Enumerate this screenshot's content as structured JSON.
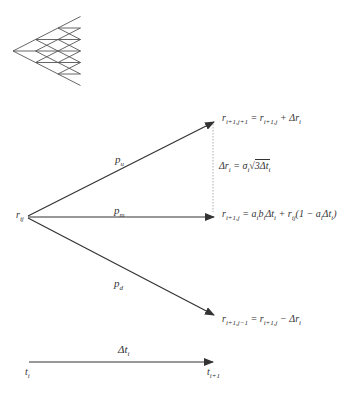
{
  "tree": {
    "description": "trinomial tree",
    "levels": 4
  },
  "labels": {
    "r_ij": "r",
    "r_ij_sub": "ij",
    "p_u": "p",
    "p_u_sub": "u",
    "p_m": "p",
    "p_m_sub": "m",
    "p_d": "p",
    "p_d_sub": "d",
    "eq_up_lhs": "r",
    "eq_up_lhs_sub": "i+1,j+1",
    "eq_up_rhs": " = r",
    "eq_up_rhs_sub": "i+1,j",
    "eq_up_tail": " + Δr",
    "eq_up_tail_sub": "i",
    "eq_dr_lhs": "Δr",
    "eq_dr_lhs_sub": "i",
    "eq_dr_mid": " = σ",
    "eq_dr_mid_sub": "i",
    "eq_dr_sqrt": "3Δt",
    "eq_dr_sqrt_sub": "i",
    "eq_mid_lhs": "r",
    "eq_mid_lhs_sub": "i+1,j",
    "eq_mid_a1": " = a",
    "eq_mid_a1_sub": "i",
    "eq_mid_b": "b",
    "eq_mid_b_sub": "i",
    "eq_mid_dt": "Δt",
    "eq_mid_dt_sub": "i",
    "eq_mid_plus": " + r",
    "eq_mid_plus_sub": "ij",
    "eq_mid_paren": "(1 − a",
    "eq_mid_paren_sub": "i",
    "eq_mid_dt2": "Δt",
    "eq_mid_dt2_sub": "i",
    "eq_mid_close": ")",
    "eq_down_lhs": "r",
    "eq_down_lhs_sub": "i+1,j−1",
    "eq_down_rhs": " = r",
    "eq_down_rhs_sub": "i+1,j",
    "eq_down_tail": " − Δr",
    "eq_down_tail_sub": "i",
    "dt": "Δt",
    "dt_sub": "i",
    "t_i": "t",
    "t_i_sub": "i",
    "t_next": "t",
    "t_next_sub": "i+1"
  },
  "colors": {
    "line": "#333333",
    "dotted": "#999999"
  }
}
